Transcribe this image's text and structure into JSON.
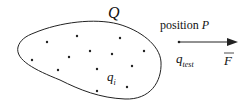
{
  "diagram": {
    "region_label": "Q",
    "charge_label": "q",
    "charge_subscript": "i",
    "position_word": "position",
    "position_symbol": "P",
    "test_charge_label": "q",
    "test_charge_subscript": "test",
    "force_label": "F",
    "colors": {
      "stroke": "#222222",
      "text": "#111111"
    },
    "charge_points": [
      [
        47,
        42
      ],
      [
        77,
        36
      ],
      [
        120,
        38
      ],
      [
        144,
        51
      ],
      [
        32,
        60
      ],
      [
        69,
        57
      ],
      [
        90,
        51
      ],
      [
        112,
        54
      ],
      [
        58,
        70
      ],
      [
        97,
        69
      ],
      [
        132,
        66
      ],
      [
        97,
        91
      ],
      [
        127,
        87
      ]
    ]
  }
}
